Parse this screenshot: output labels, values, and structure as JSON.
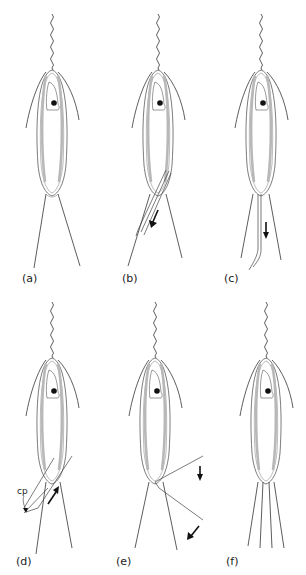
{
  "figure": {
    "panels": [
      {
        "id": "a",
        "label": "(a)",
        "x": 22,
        "y": 274
      },
      {
        "id": "b",
        "label": "(b)",
        "x": 122,
        "y": 274
      },
      {
        "id": "c",
        "label": "(c)",
        "x": 222,
        "y": 274
      },
      {
        "id": "d",
        "label": "(d)",
        "x": 18,
        "y": 557
      },
      {
        "id": "e",
        "label": "(e)",
        "x": 118,
        "y": 557
      },
      {
        "id": "f",
        "label": "(f)",
        "x": 228,
        "y": 557
      }
    ],
    "annotations": {
      "cp_label": "cp"
    },
    "colors": {
      "line": "#333333",
      "body_band": "#b8b8b8",
      "nucleus": "#111111",
      "arrow": "#111111"
    }
  }
}
